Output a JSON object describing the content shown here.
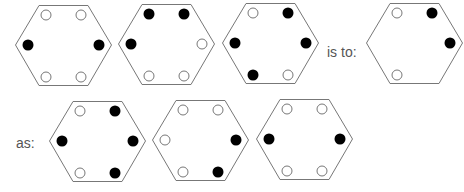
{
  "puzzle": {
    "connector_is_to": "is to:",
    "connector_as": "as:",
    "colors": {
      "stroke": "#777777",
      "filled": "#000000",
      "open_fill": "#ffffff",
      "open_stroke": "#777777",
      "text": "#555555"
    },
    "slot_order": [
      "top-left",
      "top-right",
      "right",
      "bottom-right",
      "bottom-left",
      "left"
    ],
    "premise": [
      {
        "id": "A1",
        "slots": {
          "top-left": "open",
          "top-right": "open",
          "right": "filled",
          "bottom-right": "open",
          "bottom-left": "open",
          "left": "filled"
        }
      },
      {
        "id": "A2",
        "slots": {
          "top-left": "filled",
          "top-right": "filled",
          "right": "open",
          "bottom-right": "open",
          "bottom-left": "open",
          "left": "filled"
        }
      },
      {
        "id": "A3",
        "slots": {
          "top-left": "open",
          "top-right": "filled",
          "right": "filled",
          "bottom-right": "open",
          "bottom-left": "filled",
          "left": "filled"
        }
      }
    ],
    "premise_result": {
      "id": "A4",
      "slots": {
        "top-left": "open",
        "top-right": "filled",
        "right": "filled",
        "bottom-right": "none",
        "bottom-left": "open",
        "left": "none"
      }
    },
    "options": [
      {
        "id": "B1",
        "slots": {
          "top-left": "open",
          "top-right": "filled",
          "right": "filled",
          "bottom-right": "filled",
          "bottom-left": "open",
          "left": "filled"
        }
      },
      {
        "id": "B2",
        "slots": {
          "top-left": "open",
          "top-right": "open",
          "right": "filled",
          "bottom-right": "filled",
          "bottom-left": "open",
          "left": "open"
        }
      },
      {
        "id": "B3",
        "slots": {
          "top-left": "open",
          "top-right": "open",
          "right": "filled",
          "bottom-right": "open",
          "bottom-left": "open",
          "left": "filled"
        }
      }
    ]
  }
}
